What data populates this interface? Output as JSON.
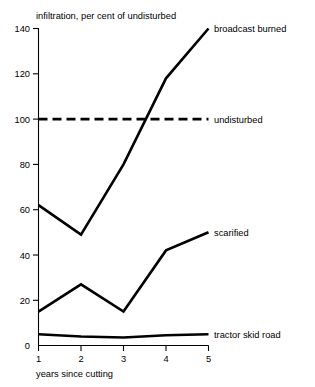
{
  "chart_data": {
    "type": "line",
    "title": "infiltration, per cent of undisturbed",
    "xlabel": "years since cutting",
    "ylabel": "",
    "x": [
      1,
      2,
      3,
      4,
      5
    ],
    "categories": [
      "1",
      "2",
      "3",
      "4",
      "5"
    ],
    "xlim": [
      1,
      5
    ],
    "ylim": [
      0,
      140
    ],
    "yticks": [
      0,
      20,
      40,
      60,
      80,
      100,
      120,
      140
    ],
    "ytick_labels": [
      "0",
      "20",
      "40",
      "60",
      "80",
      "100",
      "120",
      "140"
    ],
    "xtick_labels": [
      "1",
      "2",
      "3",
      "4",
      "5"
    ],
    "grid": false,
    "legend": "inline-right-labels",
    "series": [
      {
        "name": "broadcast burned",
        "values": [
          62,
          49,
          80,
          118,
          140
        ],
        "style": "solid",
        "label_x": 5,
        "label_y": 140
      },
      {
        "name": "undisturbed",
        "values": [
          100,
          100,
          100,
          100,
          100
        ],
        "style": "dashed",
        "label_x": 5,
        "label_y": 100
      },
      {
        "name": "scarified",
        "values": [
          15,
          27,
          15,
          42,
          50
        ],
        "style": "solid",
        "label_x": 5,
        "label_y": 50
      },
      {
        "name": "tractor skid road",
        "values": [
          5,
          4,
          3.5,
          4.5,
          5
        ],
        "style": "solid",
        "label_x": 5,
        "label_y": 5
      }
    ]
  },
  "labels": {
    "title": "infiltration, per cent of undisturbed",
    "xlabel": "years since cutting",
    "series_broadcast_burned": "broadcast burned",
    "series_undisturbed": "undisturbed",
    "series_scarified": "scarified",
    "series_tractor_skid_road": "tractor skid road",
    "y0": "0",
    "y20": "20",
    "y40": "40",
    "y60": "60",
    "y80": "80",
    "y100": "100",
    "y120": "120",
    "y140": "140",
    "x1": "1",
    "x2": "2",
    "x3": "3",
    "x4": "4",
    "x5": "5"
  },
  "colors": {
    "ink": "#000000",
    "background": "#ffffff"
  }
}
